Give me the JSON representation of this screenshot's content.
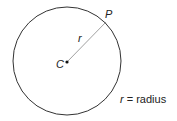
{
  "diagram": {
    "center_label": "C",
    "point_label": "P",
    "radius_label": "r",
    "caption_var": "r",
    "caption_rest": " = radius"
  }
}
